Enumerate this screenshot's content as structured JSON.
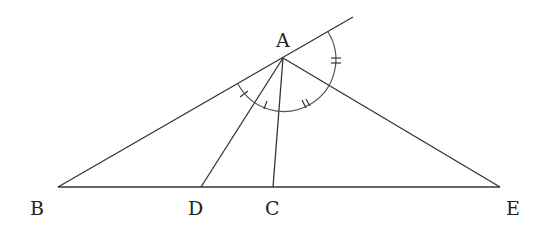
{
  "diagram": {
    "type": "geometry",
    "points": {
      "A": {
        "label": "A",
        "x": 283,
        "y": 58
      },
      "B": {
        "label": "B",
        "x": 58,
        "y": 187
      },
      "D": {
        "label": "D",
        "x": 201,
        "y": 187
      },
      "C": {
        "label": "C",
        "x": 273,
        "y": 187
      },
      "E": {
        "label": "E",
        "x": 500,
        "y": 187
      }
    },
    "segments": [
      "AB",
      "AD",
      "AC",
      "AE",
      "BE",
      "A-extension of BA"
    ],
    "angle_marks": [
      {
        "angle": "BAD",
        "mark": "single tick"
      },
      {
        "angle": "DAC",
        "mark": "single tick"
      },
      {
        "angle": "CAE",
        "mark": "double tick"
      },
      {
        "angle": "EA-extension",
        "mark": "double tick"
      }
    ],
    "labels": {
      "A": "A",
      "B": "B",
      "C": "C",
      "D": "D",
      "E": "E"
    }
  }
}
